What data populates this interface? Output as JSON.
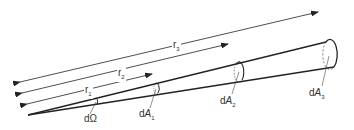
{
  "diagram": {
    "distances": [
      {
        "id": "r1",
        "label": "r",
        "sub": "1"
      },
      {
        "id": "r2",
        "label": "r",
        "sub": "2"
      },
      {
        "id": "r3",
        "label": "r",
        "sub": "3"
      }
    ],
    "areas": [
      {
        "id": "dOmega",
        "label": "dΩ",
        "sub": ""
      },
      {
        "id": "dA1",
        "label": "d",
        "italic": "A",
        "sub": "1"
      },
      {
        "id": "dA2",
        "label": "d",
        "italic": "A",
        "sub": "2"
      },
      {
        "id": "dA3",
        "label": "d",
        "italic": "A",
        "sub": "3"
      }
    ],
    "colors": {
      "stroke": "#222222",
      "label": "#333333",
      "background": "#ffffff"
    }
  }
}
